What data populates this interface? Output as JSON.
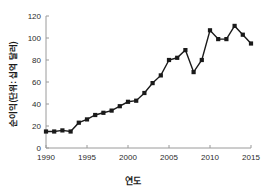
{
  "chart_data": {
    "type": "line",
    "title": "",
    "subtitle": "",
    "xlabel": "연도",
    "ylabel": "순이익(단위: 십억 달러)",
    "xlim": [
      1990,
      2015
    ],
    "ylim": [
      0,
      120
    ],
    "xticks": [
      1990,
      1995,
      2000,
      2005,
      2010,
      2015
    ],
    "yticks": [
      0,
      20,
      40,
      60,
      80,
      100,
      120
    ],
    "grid": false,
    "legend": null,
    "legend_position": "none",
    "marker": "square",
    "marker_color": "#1a1a1a",
    "line_color": "#1a1a1a",
    "x": [
      1990,
      1991,
      1992,
      1993,
      1994,
      1995,
      1996,
      1997,
      1998,
      1999,
      2000,
      2001,
      2002,
      2003,
      2004,
      2005,
      2006,
      2007,
      2008,
      2009,
      2010,
      2011,
      2012,
      2013,
      2014,
      2015
    ],
    "values": [
      15,
      15,
      16,
      15,
      23,
      26,
      30,
      32,
      34,
      38,
      42,
      43,
      50,
      59,
      66,
      80,
      82,
      89,
      69,
      80,
      107,
      99,
      99,
      111,
      103,
      95
    ],
    "series": [
      {
        "name": "순이익",
        "values": [
          15,
          15,
          16,
          15,
          23,
          26,
          30,
          32,
          34,
          38,
          42,
          43,
          50,
          59,
          66,
          80,
          82,
          89,
          69,
          80,
          107,
          99,
          99,
          111,
          103,
          95
        ]
      }
    ]
  },
  "axis": {
    "x_tick_labels": [
      "1990",
      "1995",
      "2000",
      "2005",
      "2010",
      "2015"
    ],
    "y_tick_labels": [
      "0",
      "20",
      "40",
      "60",
      "80",
      "100",
      "120"
    ]
  }
}
